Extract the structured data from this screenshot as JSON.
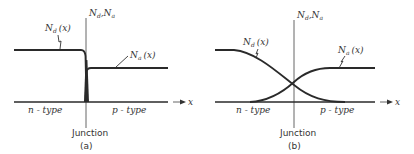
{
  "figure": {
    "panels": [
      {
        "id": "a",
        "caption": "(a)",
        "axis_label": "N_d, N_a",
        "x_axis_label": "x",
        "curve_labels": {
          "donor": "N_d (x)",
          "acceptor": "N_a (x)"
        },
        "region_labels": {
          "left": "n-type",
          "right": "p-type"
        },
        "junction_label": "Junction",
        "profile": "abrupt"
      },
      {
        "id": "b",
        "caption": "(b)",
        "axis_label": "N_d, N_a",
        "x_axis_label": "x",
        "curve_labels": {
          "donor": "N_d (x)",
          "acceptor": "N_a (x)"
        },
        "region_labels": {
          "left": "n-type",
          "right": "p-type"
        },
        "junction_label": "Junction",
        "profile": "graded"
      }
    ],
    "text": {
      "N": "N",
      "d": "d",
      "a": "a",
      "x_paren": "(x)",
      "comma": ",",
      "x": "x",
      "n_type": "n - type",
      "p_type": "p - type",
      "junction": "Junction",
      "cap_a": "(a)",
      "cap_b": "(b)"
    }
  }
}
